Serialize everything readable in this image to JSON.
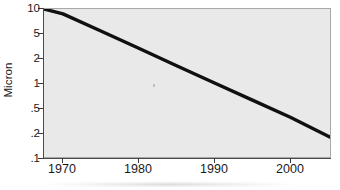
{
  "chart_data": {
    "type": "line",
    "title": "",
    "xlabel": "",
    "ylabel": "Micron",
    "yscale": "log",
    "xscale": "linear",
    "grid": false,
    "legend": null,
    "xlim": [
      1967.5,
      2005.5
    ],
    "ylim": [
      0.1,
      10
    ],
    "xticks": [
      1970,
      1980,
      1990,
      2000
    ],
    "xtick_labels": [
      "1970",
      "1980",
      "1990",
      "2000"
    ],
    "yticks": [
      10,
      5,
      2,
      1,
      0.5,
      0.2,
      0.1
    ],
    "ytick_labels": [
      "10",
      "5",
      "2",
      "1",
      ".5",
      ".2",
      ".1"
    ],
    "series": [
      {
        "name": "Feature size",
        "color": "#101010",
        "linewidth": 3,
        "x": [
          1967.5,
          1970,
          1975,
          1980,
          1985,
          1990,
          1995,
          2000,
          2005.5
        ],
        "y": [
          10.0,
          8.6,
          5.1,
          3.0,
          1.75,
          1.03,
          0.61,
          0.36,
          0.19
        ]
      }
    ]
  },
  "axis": {
    "y_title": "Micron",
    "y_tick_labels": [
      "10",
      "5",
      "2",
      "1",
      ".5",
      ".2",
      ".1"
    ],
    "x_tick_labels": [
      "1970",
      "1980",
      "1990",
      "2000"
    ]
  },
  "colors": {
    "plot_background": "#e9e9e9",
    "frame": "#a8a8a8",
    "line": "#101010",
    "text": "#1a1a1a",
    "page_background": "#ffffff"
  }
}
